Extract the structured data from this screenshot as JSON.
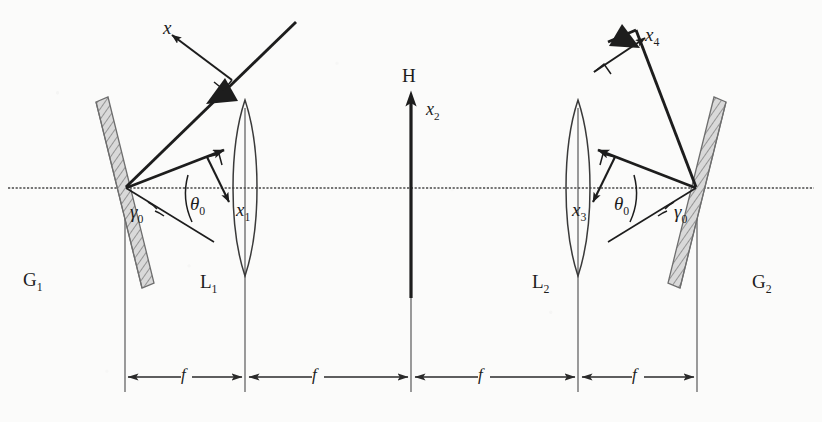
{
  "figure": {
    "kind": "optical-4f-double-grating-diagram",
    "background_color": "#fbfbfa",
    "ink_color": "#1d1d1d",
    "grating_fill_color": "#d9d9d9",
    "axis_color": "#4a4a4a"
  },
  "labels": {
    "axis_x_top_left": "x",
    "axis_x1": "x",
    "axis_x1_sub": "1",
    "axis_x2": "x",
    "axis_x2_sub": "2",
    "axis_x3": "x",
    "axis_x3_sub": "3",
    "axis_x4": "x",
    "axis_x4_sub": "4",
    "grating_left": "G",
    "grating_left_sub": "1",
    "grating_right": "G",
    "grating_right_sub": "2",
    "lens_left": "L",
    "lens_left_sub": "1",
    "lens_right": "L",
    "lens_right_sub": "2",
    "hologram": "H",
    "gamma_left": "γ",
    "gamma_left_sub": "0",
    "theta_left": "θ",
    "theta_left_sub": "0",
    "theta_right": "θ",
    "theta_right_sub": "0",
    "gamma_right": "γ",
    "gamma_right_sub": "0"
  },
  "dimensions": {
    "label": "f",
    "segments": [
      {
        "id": "seg-1",
        "label": "f",
        "from": "G1",
        "to": "L1"
      },
      {
        "id": "seg-2",
        "label": "f",
        "from": "L1",
        "to": "H"
      },
      {
        "id": "seg-3",
        "label": "f",
        "from": "H",
        "to": "L2"
      },
      {
        "id": "seg-4",
        "label": "f",
        "from": "L2",
        "to": "G2"
      }
    ]
  },
  "geometry": {
    "optical_axis_y": 188,
    "grating_left_x": 125,
    "lens_left_x": 245,
    "hologram_x": 411,
    "lens_right_x": 578,
    "grating_right_x": 697,
    "dimension_line_y": 377
  }
}
